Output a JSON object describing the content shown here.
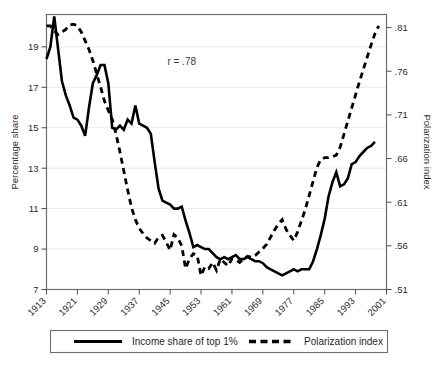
{
  "chart_data": {
    "type": "line",
    "title": "",
    "subtitle": "",
    "xlabel": "",
    "ylabel": "Percentage share",
    "y2label": "Polarization index",
    "xlim": [
      1913,
      2001
    ],
    "ylim": [
      7,
      20.6
    ],
    "y2lim": [
      0.51,
      0.825
    ],
    "grid": true,
    "legend_position": "bottom",
    "annotations": [
      {
        "text": "r = .78",
        "x": 1948,
        "y": 18.1
      }
    ],
    "xticks": [
      1913,
      1921,
      1929,
      1937,
      1945,
      1953,
      1961,
      1969,
      1977,
      1985,
      1993,
      2001
    ],
    "xtick_labels": [
      "1913",
      "1921",
      "1929",
      "1937",
      "1945",
      "1953",
      "1961",
      "1969",
      "1977",
      "1985",
      "1993",
      "2001"
    ],
    "yticks": [
      7,
      9,
      11,
      13,
      15,
      17,
      19
    ],
    "ytick_labels": [
      "7",
      "9",
      "11",
      "13",
      "15",
      "17",
      "19"
    ],
    "y2ticks": [
      0.51,
      0.56,
      0.61,
      0.66,
      0.71,
      0.76,
      0.81
    ],
    "y2tick_labels": [
      ".51",
      ".56",
      ".61",
      ".66",
      ".71",
      ".76",
      ".81"
    ],
    "series": [
      {
        "name": "Income share of top 1%",
        "axis": "left",
        "style": "solid",
        "color": "#000000",
        "x": [
          1913,
          1914,
          1915,
          1916,
          1917,
          1918,
          1919,
          1920,
          1921,
          1922,
          1923,
          1924,
          1925,
          1926,
          1927,
          1928,
          1929,
          1930,
          1931,
          1932,
          1933,
          1934,
          1935,
          1936,
          1937,
          1938,
          1939,
          1940,
          1941,
          1942,
          1943,
          1944,
          1945,
          1946,
          1947,
          1948,
          1949,
          1950,
          1951,
          1952,
          1953,
          1954,
          1955,
          1956,
          1957,
          1958,
          1959,
          1960,
          1961,
          1962,
          1963,
          1964,
          1965,
          1966,
          1967,
          1968,
          1969,
          1970,
          1971,
          1972,
          1973,
          1974,
          1975,
          1976,
          1977,
          1978,
          1979,
          1980,
          1981,
          1982,
          1983,
          1984,
          1985,
          1986,
          1987,
          1988,
          1989,
          1990,
          1991,
          1992,
          1993,
          1994,
          1995,
          1996,
          1997,
          1998
        ],
        "values": [
          18.4,
          19.0,
          20.5,
          18.9,
          17.3,
          16.6,
          16.1,
          15.5,
          15.4,
          15.1,
          14.6,
          16.0,
          17.2,
          17.6,
          18.1,
          18.1,
          17.2,
          15.0,
          14.9,
          15.1,
          14.9,
          15.4,
          15.2,
          16.1,
          15.2,
          15.1,
          15.0,
          14.7,
          13.3,
          12.0,
          11.4,
          11.3,
          11.2,
          11.0,
          11.0,
          11.1,
          10.4,
          9.8,
          9.1,
          9.2,
          9.1,
          9.0,
          9.0,
          8.8,
          8.6,
          8.5,
          8.6,
          8.5,
          8.6,
          8.7,
          8.5,
          8.5,
          8.6,
          8.5,
          8.4,
          8.4,
          8.3,
          8.1,
          8.0,
          7.9,
          7.8,
          7.7,
          7.8,
          7.9,
          8.0,
          7.9,
          8.0,
          8.0,
          8.0,
          8.4,
          9.0,
          9.7,
          10.5,
          11.6,
          12.3,
          12.8,
          12.1,
          12.2,
          12.5,
          13.2,
          13.3,
          13.6,
          13.8,
          14.0,
          14.1,
          14.3
        ]
      },
      {
        "name": "Polarization index",
        "axis": "right",
        "style": "dashed",
        "color": "#000000",
        "x": [
          1913,
          1914,
          1915,
          1916,
          1917,
          1918,
          1919,
          1920,
          1921,
          1922,
          1923,
          1924,
          1925,
          1926,
          1927,
          1928,
          1929,
          1930,
          1931,
          1932,
          1933,
          1934,
          1935,
          1936,
          1937,
          1938,
          1939,
          1940,
          1941,
          1942,
          1943,
          1944,
          1945,
          1946,
          1947,
          1948,
          1949,
          1950,
          1951,
          1952,
          1953,
          1954,
          1955,
          1956,
          1957,
          1958,
          1959,
          1960,
          1961,
          1962,
          1963,
          1964,
          1965,
          1966,
          1967,
          1968,
          1969,
          1970,
          1971,
          1972,
          1973,
          1974,
          1975,
          1976,
          1977,
          1978,
          1979,
          1980,
          1981,
          1982,
          1983,
          1984,
          1985,
          1986,
          1987,
          1988,
          1989,
          1990,
          1991,
          1992,
          1993,
          1994,
          1995,
          1996,
          1997,
          1998,
          1999
        ],
        "values": [
          0.812,
          0.812,
          0.806,
          0.802,
          0.805,
          0.808,
          0.813,
          0.814,
          0.812,
          0.805,
          0.795,
          0.785,
          0.772,
          0.757,
          0.742,
          0.726,
          0.715,
          0.705,
          0.688,
          0.668,
          0.646,
          0.624,
          0.604,
          0.59,
          0.58,
          0.574,
          0.569,
          0.566,
          0.563,
          0.57,
          0.572,
          0.564,
          0.555,
          0.573,
          0.569,
          0.56,
          0.534,
          0.545,
          0.551,
          0.549,
          0.526,
          0.536,
          0.534,
          0.541,
          0.532,
          0.545,
          0.541,
          0.537,
          0.545,
          0.544,
          0.541,
          0.545,
          0.548,
          0.547,
          0.549,
          0.553,
          0.557,
          0.562,
          0.57,
          0.578,
          0.585,
          0.59,
          0.579,
          0.572,
          0.566,
          0.576,
          0.589,
          0.602,
          0.618,
          0.634,
          0.65,
          0.659,
          0.661,
          0.661,
          0.662,
          0.664,
          0.673,
          0.688,
          0.703,
          0.718,
          0.733,
          0.748,
          0.762,
          0.776,
          0.79,
          0.803,
          0.812
        ]
      }
    ]
  },
  "legend": {
    "items": [
      {
        "label": "Income share of top 1%",
        "style": "solid"
      },
      {
        "label": "Polarization index",
        "style": "dashed"
      }
    ]
  },
  "axes": {
    "left_title": "Percentage share",
    "right_title": "Polarization index"
  },
  "annotation": {
    "correlation": "r = .78"
  },
  "colors": {
    "line": "#000000",
    "frame": "#6e6e6e",
    "grid": "#e9e9e9",
    "background": "#ffffff"
  }
}
